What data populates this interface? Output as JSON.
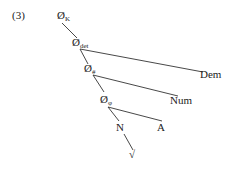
{
  "example_number": "(3)",
  "tree": {
    "nodes": {
      "k": {
        "symbol": "Ø",
        "subscript": "K"
      },
      "det": {
        "symbol": "Ø",
        "subscript": "det"
      },
      "num": {
        "symbol": "Ø",
        "subscript": "#"
      },
      "phi": {
        "symbol": "Ø",
        "subscript": "φ"
      },
      "dem": {
        "label": "Dem"
      },
      "numleaf": {
        "label": "Num"
      },
      "n": {
        "label": "N"
      },
      "a": {
        "label": "A"
      },
      "root": {
        "label": "√"
      }
    }
  }
}
